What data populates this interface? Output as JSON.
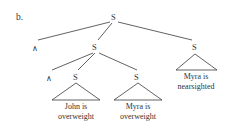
{
  "figure": {
    "label": "b.",
    "nodes": {
      "root": "S",
      "left_conj": "∧",
      "mid": "S",
      "right": "S",
      "inner_conj": "∧",
      "john_s": "S",
      "myra_s": "S"
    },
    "leaves": {
      "john": [
        "John is",
        "overweight"
      ],
      "myra_over": [
        "Myra is",
        "overweight"
      ],
      "myra_near": [
        "Myra is",
        "nearsighted"
      ]
    }
  }
}
